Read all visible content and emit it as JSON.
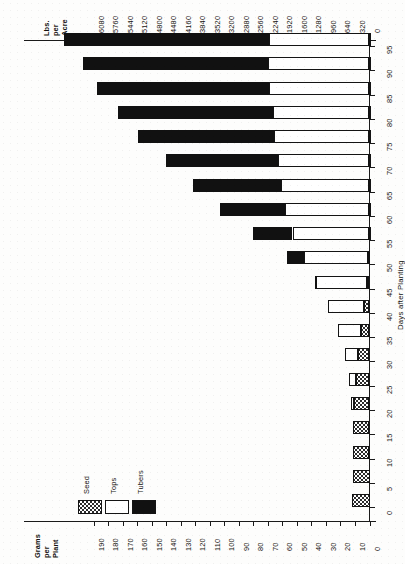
{
  "figure": {
    "orientation": "rotated-90",
    "background_color": "#fdfdfc"
  },
  "top_axis": {
    "title_lines": [
      "Lbs.",
      "per",
      "Acre"
    ],
    "ticks": [
      "6080",
      "5760",
      "5440",
      "5120",
      "4800",
      "4480",
      "4160",
      "3840",
      "3520",
      "3200",
      "2880",
      "2560",
      "2240",
      "1920",
      "1600",
      "1280",
      "960",
      "640",
      "320",
      "0"
    ]
  },
  "bottom_axis": {
    "title_lines": [
      "Grams",
      "per",
      "Plant"
    ],
    "ticks": [
      "190",
      "180",
      "170",
      "160",
      "150",
      "140",
      "130",
      "120",
      "110",
      "100",
      "90",
      "80",
      "70",
      "60",
      "50",
      "40",
      "30",
      "20",
      "10",
      "0"
    ]
  },
  "category_axis": {
    "title": "Days after Planting",
    "ticks": [
      "0",
      "5",
      "10",
      "15",
      "20",
      "25",
      "30",
      "35",
      "40",
      "45",
      "50",
      "55",
      "60",
      "65",
      "70",
      "75",
      "80",
      "85",
      "90",
      "95"
    ]
  },
  "legend": {
    "items": [
      {
        "label": "Seed",
        "swatch": "dotted",
        "color": "#ffffff"
      },
      {
        "label": "Tops",
        "swatch": "open",
        "color": "#ffffff"
      },
      {
        "label": "Tubers",
        "swatch": "solid",
        "color": "#111111"
      }
    ]
  },
  "chart_data": {
    "type": "bar",
    "title": "",
    "subtype": "stacked-horizontal",
    "xlabel": "Days after Planting",
    "ylabel": "Lbs. per Acre",
    "ylabel_secondary": "Grams per Plant",
    "ylim": [
      0,
      6080
    ],
    "ylim_secondary": [
      0,
      190
    ],
    "y_tick_step": 320,
    "y_tick_step_secondary": 10,
    "grid": false,
    "legend_position": "lower-left",
    "units": "lbs per acre (primary) / grams per plant (secondary)",
    "categories": [
      "0",
      "5",
      "10",
      "15",
      "20",
      "25",
      "30",
      "35",
      "40",
      "45",
      "50",
      "55",
      "60",
      "65",
      "70",
      "75",
      "80",
      "85",
      "90",
      "95"
    ],
    "series": [
      {
        "name": "Seed",
        "values": [
          380,
          375,
          370,
          360,
          340,
          300,
          250,
          180,
          120,
          60,
          30,
          15,
          10,
          10,
          10,
          10,
          10,
          10,
          10,
          10
        ]
      },
      {
        "name": "Tops",
        "values": [
          0,
          0,
          0,
          0,
          60,
          160,
          300,
          520,
          790,
          1110,
          1420,
          1680,
          1860,
          1940,
          2010,
          2090,
          2120,
          2200,
          2230,
          2210
        ]
      },
      {
        "name": "Tubers",
        "values": [
          0,
          0,
          0,
          0,
          0,
          0,
          0,
          0,
          0,
          40,
          360,
          880,
          1420,
          1930,
          2470,
          3010,
          3420,
          3790,
          4070,
          4510
        ]
      }
    ],
    "totals": [
      380,
      375,
      370,
      360,
      400,
      460,
      550,
      700,
      910,
      1210,
      1810,
      2575,
      3290,
      3880,
      4490,
      5110,
      5550,
      6000,
      6310,
      6730
    ]
  }
}
